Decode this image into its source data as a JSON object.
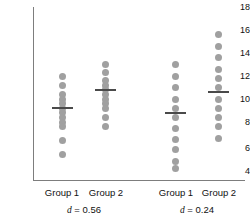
{
  "chart_data": {
    "type": "scatter",
    "title": "",
    "xlabel": "",
    "ylabel": "",
    "ylim": [
      4,
      18
    ],
    "grid": false,
    "legend": false,
    "yticks": [
      18,
      16,
      14,
      12,
      10,
      8,
      6,
      4
    ],
    "categories": [
      "Group 1",
      "Group 2",
      "Group 1",
      "Group 2"
    ],
    "annotations": [
      "d = 0.56",
      "d = 0.24"
    ],
    "panels": [
      {
        "effect_size_label": "d = 0.56",
        "effect_size": 0.56,
        "groups": [
          {
            "name": "Group 1",
            "mean": 9.2,
            "values": [
              12.0,
              11.2,
              10.4,
              10.0,
              9.6,
              9.2,
              8.8,
              8.4,
              8.0,
              7.6,
              6.4,
              5.2
            ]
          },
          {
            "name": "Group 2",
            "mean": 10.8,
            "values": [
              13.0,
              12.3,
              11.6,
              11.2,
              10.8,
              10.4,
              10.0,
              9.6,
              9.2,
              8.4,
              7.6
            ]
          }
        ]
      },
      {
        "effect_size_label": "d = 0.24",
        "effect_size": 0.24,
        "groups": [
          {
            "name": "Group 1",
            "mean": 8.8,
            "values": [
              13.0,
              12.0,
              11.0,
              10.0,
              9.2,
              8.4,
              7.4,
              6.5,
              5.6,
              4.6,
              4.0
            ]
          },
          {
            "name": "Group 2",
            "mean": 10.6,
            "values": [
              15.6,
              14.6,
              13.6,
              12.6,
              11.8,
              11.0,
              10.0,
              9.2,
              8.4,
              7.6,
              6.6
            ]
          }
        ]
      }
    ]
  },
  "axis": {
    "tick_18": "18",
    "tick_16": "16",
    "tick_14": "14",
    "tick_12": "12",
    "tick_10": "10",
    "tick_8": "8",
    "tick_6": "6",
    "tick_4": "4"
  },
  "labels": {
    "group_1a": "Group 1",
    "group_2a": "Group 2",
    "group_1b": "Group 1",
    "group_2b": "Group 2",
    "d_left_prefix": "d",
    "d_left_value": "= 0.56",
    "d_right_prefix": "d",
    "d_right_value": "= 0.24"
  },
  "colors": {
    "dot": "#a0a0a0",
    "mean_line": "#4a4a4a",
    "axis": "#7d7d7d",
    "text": "#111111"
  }
}
